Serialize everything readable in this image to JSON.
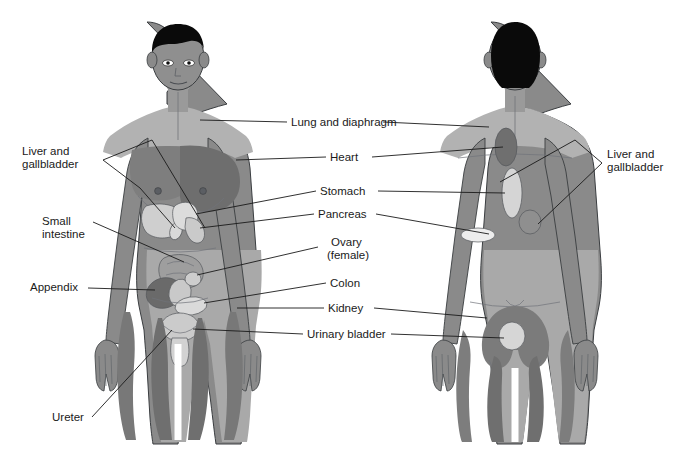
{
  "figure": {
    "background_color": "#ffffff",
    "width": 679,
    "height": 449
  },
  "palette": {
    "skin_mid": "#8a8a8a",
    "skin_light": "#a9a9a9",
    "skin_lighter": "#b8b8b8",
    "zone_dark": "#6e6e6e",
    "zone_darker": "#5d5d5d",
    "organ_pale": "#d7d7d7",
    "organ_light": "#c4c4c4",
    "organ_mid": "#9a9a9a",
    "organ_dark": "#6a6a6a",
    "hair": "#0a0a0a",
    "outline": "#3a3d40",
    "leader": "#1a1a1a",
    "text": "#1a1a1a"
  },
  "views": [
    {
      "name": "anterior",
      "description": "front view of male figure"
    },
    {
      "name": "posterior",
      "description": "back view of male figure"
    }
  ],
  "labels": {
    "left": [
      {
        "id": "liver-gallbladder-left",
        "text_lines": [
          "Liver and",
          "gallbladder"
        ],
        "x": 22,
        "y": 155,
        "align": "start"
      },
      {
        "id": "small-intestine",
        "text_lines": [
          "Small",
          "intestine"
        ],
        "x": 42,
        "y": 225,
        "align": "start"
      },
      {
        "id": "appendix",
        "text_lines": [
          "Appendix"
        ],
        "x": 30,
        "y": 291,
        "align": "start"
      },
      {
        "id": "ureter",
        "text_lines": [
          "Ureter"
        ],
        "x": 52,
        "y": 421,
        "align": "start"
      }
    ],
    "center": [
      {
        "id": "lung-diaphragm",
        "text_lines": [
          "Lung and diaphragm"
        ],
        "x": 291,
        "y": 126,
        "align": "start"
      },
      {
        "id": "heart",
        "text_lines": [
          "Heart"
        ],
        "x": 330,
        "y": 161,
        "align": "start"
      },
      {
        "id": "stomach",
        "text_lines": [
          "Stomach"
        ],
        "x": 320,
        "y": 195,
        "align": "start"
      },
      {
        "id": "pancreas",
        "text_lines": [
          "Pancreas"
        ],
        "x": 318,
        "y": 218,
        "align": "start"
      },
      {
        "id": "ovary-female",
        "text_lines": [
          "Ovary",
          "(female)"
        ],
        "x": 348,
        "y": 246,
        "align": "middle"
      },
      {
        "id": "colon",
        "text_lines": [
          "Colon"
        ],
        "x": 330,
        "y": 287,
        "align": "start"
      },
      {
        "id": "kidney",
        "text_lines": [
          "Kidney"
        ],
        "x": 328,
        "y": 312,
        "align": "start"
      },
      {
        "id": "urinary-bladder",
        "text_lines": [
          "Urinary bladder"
        ],
        "x": 307,
        "y": 338,
        "align": "start"
      }
    ],
    "right": [
      {
        "id": "liver-gallbladder-right",
        "text_lines": [
          "Liver and",
          "gallbladder"
        ],
        "x": 607,
        "y": 158,
        "align": "start"
      }
    ]
  },
  "organs_anterior": [
    {
      "id": "liver-anterior",
      "name": "liver"
    },
    {
      "id": "gallbladder-anterior",
      "name": "gallbladder"
    },
    {
      "id": "stomach-anterior",
      "name": "stomach"
    },
    {
      "id": "pancreas-anterior",
      "name": "pancreas"
    },
    {
      "id": "small-intestine-anterior",
      "name": "small intestine"
    },
    {
      "id": "appendix-anterior",
      "name": "appendix"
    },
    {
      "id": "ovary-anterior",
      "name": "ovary"
    },
    {
      "id": "colon-anterior",
      "name": "colon"
    },
    {
      "id": "urinary-bladder-anterior",
      "name": "urinary bladder"
    },
    {
      "id": "ureter-anterior",
      "name": "ureter"
    }
  ],
  "organs_posterior": [
    {
      "id": "heart-posterior",
      "name": "heart referral oval"
    },
    {
      "id": "stomach-posterior",
      "name": "stomach referral ellipse"
    },
    {
      "id": "liver-posterior",
      "name": "liver referral oval"
    },
    {
      "id": "pancreas-posterior",
      "name": "pancreas referral ellipse"
    },
    {
      "id": "kidney-posterior",
      "name": "kidney referral zone"
    },
    {
      "id": "urinary-bladder-posterior",
      "name": "urinary bladder referral oval"
    }
  ]
}
